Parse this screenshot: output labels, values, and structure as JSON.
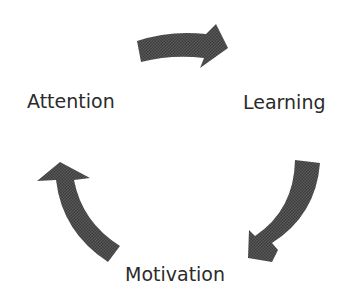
{
  "diagram": {
    "type": "cycle",
    "nodes": [
      {
        "id": "attention",
        "label": "Attention"
      },
      {
        "id": "learning",
        "label": "Learning"
      },
      {
        "id": "motivation",
        "label": "Motivation"
      }
    ],
    "edges": [
      {
        "from": "attention",
        "to": "learning",
        "icon": "curved-arrow-right-icon"
      },
      {
        "from": "learning",
        "to": "motivation",
        "icon": "curved-arrow-down-left-icon"
      },
      {
        "from": "motivation",
        "to": "attention",
        "icon": "curved-arrow-up-icon"
      }
    ],
    "colors": {
      "arrow_fill": "#555555",
      "text": "#2b2b2b",
      "background": "#ffffff"
    }
  }
}
